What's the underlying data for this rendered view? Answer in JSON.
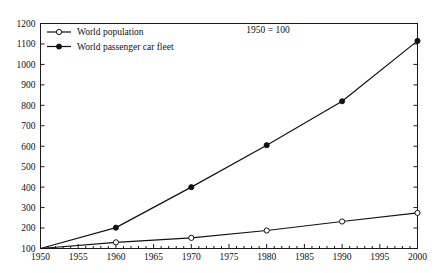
{
  "chart_data": {
    "type": "line",
    "title": "",
    "subtitle": "",
    "annotation": "1950 = 100",
    "xlabel": "",
    "ylabel": "",
    "x": [
      1950,
      1960,
      1970,
      1980,
      1990,
      2000
    ],
    "xlim": [
      1950,
      2000
    ],
    "ylim": [
      100,
      1200
    ],
    "grid": false,
    "legend_position": "top-left",
    "x_tick_labels": [
      "1950",
      "1955",
      "1960",
      "1965",
      "1970",
      "1975",
      "1980",
      "1985",
      "1990",
      "1995",
      "2000"
    ],
    "x_tick_values": [
      1950,
      1955,
      1960,
      1965,
      1970,
      1975,
      1980,
      1985,
      1990,
      1995,
      2000
    ],
    "x_minor_tick_interval": 1,
    "y_tick_labels": [
      "100",
      "200",
      "300",
      "400",
      "500",
      "600",
      "700",
      "800",
      "900",
      "1000",
      "1100",
      "1200"
    ],
    "y_tick_values": [
      100,
      200,
      300,
      400,
      500,
      600,
      700,
      800,
      900,
      1000,
      1100,
      1200
    ],
    "series": [
      {
        "name": "World population",
        "marker": "open-circle",
        "color": "#111111",
        "values": [
          100,
          130,
          152,
          188,
          232,
          274
        ]
      },
      {
        "name": "World passenger car fleet",
        "marker": "filled-circle",
        "color": "#111111",
        "values": [
          100,
          202,
          400,
          605,
          820,
          1115
        ]
      }
    ]
  },
  "legend": {
    "items": [
      {
        "label": "World population",
        "marker": "open-circle"
      },
      {
        "label": "World passenger car fleet",
        "marker": "filled-circle"
      }
    ]
  },
  "colors": {
    "line": "#111111",
    "axis": "#1a1a1a",
    "background": "#ffffff",
    "marker_fill_open": "#ffffff",
    "marker_fill_closed": "#111111"
  }
}
